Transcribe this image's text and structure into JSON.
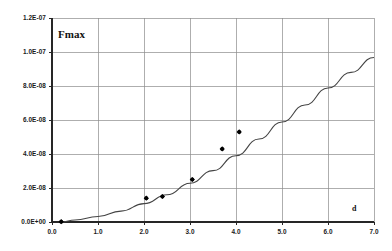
{
  "chart_data": {
    "type": "scatter",
    "title": "",
    "subtitle": "",
    "ylabel": "Fmax",
    "xlabel": "d",
    "xlim": [
      0.0,
      7.0
    ],
    "ylim": [
      0.0,
      1.2e-07
    ],
    "grid": true,
    "legend": false,
    "legend_position": "none",
    "x_ticks": [
      0.0,
      1.0,
      2.0,
      3.0,
      4.0,
      5.0,
      6.0,
      7.0
    ],
    "x_tick_labels": [
      "0.0",
      "1.0",
      "2.0",
      "3.0",
      "4.0",
      "5.0",
      "6.0",
      "7.0"
    ],
    "y_ticks": [
      0.0,
      2e-08,
      4e-08,
      6e-08,
      8e-08,
      1e-07,
      1.2e-07
    ],
    "y_tick_labels": [
      "0.0E+00",
      "2.0E-08",
      "4.0E-08",
      "6.0E-08",
      "8.0E-08",
      "1.0E-07",
      "1.2E-07"
    ],
    "series": [
      {
        "name": "measured",
        "kind": "scatter",
        "marker": "diamond",
        "color": "#000000",
        "points": [
          {
            "x": 0.2,
            "y": 2e-10
          },
          {
            "x": 2.05,
            "y": 1.4e-08
          },
          {
            "x": 2.4,
            "y": 1.5e-08
          },
          {
            "x": 3.05,
            "y": 2.5e-08
          },
          {
            "x": 3.7,
            "y": 4.3e-08
          },
          {
            "x": 4.07,
            "y": 5.3e-08
          }
        ]
      },
      {
        "name": "fit",
        "kind": "line",
        "color": "#444444",
        "points": [
          {
            "x": 0.2,
            "y": 0.0
          },
          {
            "x": 0.5,
            "y": 1.2e-09
          },
          {
            "x": 1.0,
            "y": 3.2e-09
          },
          {
            "x": 1.5,
            "y": 6.4e-09
          },
          {
            "x": 2.0,
            "y": 1.08e-08
          },
          {
            "x": 2.5,
            "y": 1.6e-08
          },
          {
            "x": 3.0,
            "y": 2.28e-08
          },
          {
            "x": 3.5,
            "y": 3.02e-08
          },
          {
            "x": 4.0,
            "y": 3.9e-08
          },
          {
            "x": 4.5,
            "y": 4.88e-08
          },
          {
            "x": 5.0,
            "y": 5.88e-08
          },
          {
            "x": 5.5,
            "y": 6.88e-08
          },
          {
            "x": 6.0,
            "y": 7.88e-08
          },
          {
            "x": 6.5,
            "y": 8.8e-08
          },
          {
            "x": 7.0,
            "y": 9.68e-08
          }
        ]
      }
    ]
  },
  "labels": {
    "y_axis_title": "Fmax",
    "x_axis_title": "d"
  }
}
